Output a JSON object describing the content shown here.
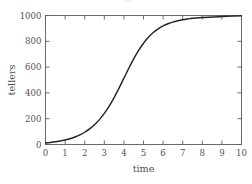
{
  "figure": {
    "background_color": "#ffffff",
    "frame_color": "#5d5a58",
    "text_color": "#54514f",
    "curve_color": "#262322"
  },
  "chart_data": {
    "type": "line",
    "title": "",
    "subtitle": "",
    "xlabel": "time",
    "ylabel": "tellers",
    "xlim": [
      0,
      10
    ],
    "ylim": [
      0,
      1000
    ],
    "xticks": [
      0,
      1,
      2,
      3,
      4,
      5,
      6,
      7,
      8,
      9,
      10
    ],
    "xtick_labels": [
      "0",
      "1",
      "2",
      "3",
      "4",
      "5",
      "6",
      "7",
      "8",
      "9",
      "10"
    ],
    "yticks": [
      0,
      200,
      400,
      600,
      800,
      1000
    ],
    "ytick_labels": [
      "0",
      "200",
      "400",
      "600",
      "800",
      "1000"
    ],
    "grid": false,
    "legend": null,
    "legend_position": "none",
    "frame": "box",
    "tick_direction": "in",
    "annotations": [],
    "series": [
      {
        "name": "tellers",
        "x": [
          0.0,
          0.25,
          0.5,
          0.75,
          1.0,
          1.25,
          1.5,
          1.75,
          2.0,
          2.25,
          2.5,
          2.75,
          3.0,
          3.25,
          3.5,
          3.75,
          4.0,
          4.25,
          4.5,
          4.75,
          5.0,
          5.25,
          5.5,
          5.75,
          6.0,
          6.25,
          6.5,
          6.75,
          7.0,
          7.25,
          7.5,
          7.75,
          8.0,
          8.5,
          9.0,
          9.5,
          10.0
        ],
        "y": [
          12,
          16,
          21,
          27,
          35,
          45,
          58,
          74,
          95,
          121,
          153,
          193,
          241,
          298,
          364,
          437,
          514,
          591,
          664,
          729,
          785,
          831,
          868,
          897,
          919,
          936,
          949,
          959,
          967,
          973,
          978,
          981,
          984,
          989,
          992,
          995,
          997
        ]
      }
    ]
  }
}
